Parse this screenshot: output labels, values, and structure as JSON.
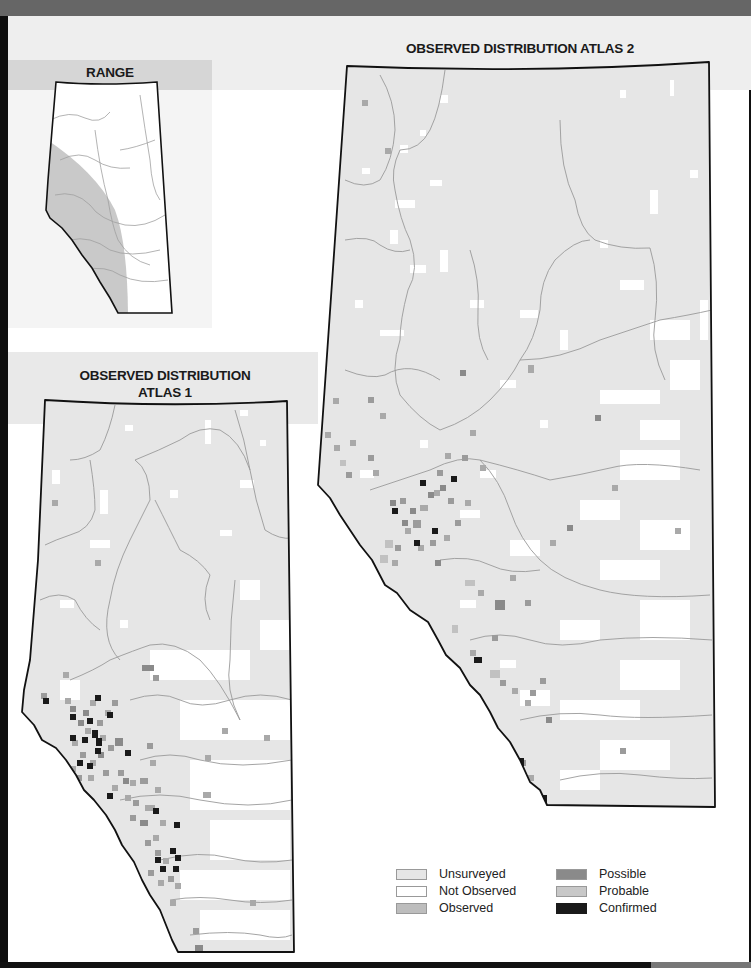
{
  "titles": {
    "range": "RANGE",
    "atlas2": "OBSERVED DISTRIBUTION ATLAS 2",
    "atlas1_line1": "OBSERVED DISTRIBUTION",
    "atlas1_line2": "ATLAS 1"
  },
  "colors": {
    "unsurveyed": "#e6e6e6",
    "not_observed": "#ffffff",
    "observed": "#bdbdbd",
    "possible": "#8a8a8a",
    "probable": "#c8c8c8",
    "confirmed": "#1a1a1a",
    "range_shade": "#c9c9c9",
    "border": "#111111",
    "river": "#9a9a9a"
  },
  "legend": {
    "items": [
      {
        "label": "Unsurveyed",
        "color": "#e6e6e6"
      },
      {
        "label": "Not Observed",
        "color": "#ffffff"
      },
      {
        "label": "Observed",
        "color": "#bdbdbd"
      },
      {
        "label": "Possible",
        "color": "#8a8a8a"
      },
      {
        "label": "Probable",
        "color": "#c8c8c8"
      },
      {
        "label": "Confirmed",
        "color": "#1a1a1a"
      }
    ]
  },
  "maps": {
    "range": {
      "region": "Alberta",
      "shaded_area": "southwestern arc (foothills and mountains)"
    },
    "atlas2": {
      "region": "Alberta",
      "hotspots": [
        "central foothills cluster",
        "southwestern mountain edge"
      ]
    },
    "atlas1": {
      "region": "Alberta",
      "hotspots": [
        "west-central foothills cluster",
        "southwestern foothills"
      ]
    }
  }
}
